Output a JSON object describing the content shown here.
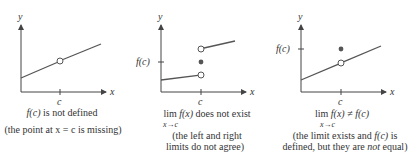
{
  "panels": [
    {
      "id": "not-defined",
      "axis_y_label": "y",
      "axis_x_label": "x",
      "tick_label_c": "c",
      "caption": {
        "line1_func": "f(c)",
        "line1_rest": " is not defined",
        "line2": "(the point at x = c is missing)"
      },
      "points": {
        "open": [
          [
            60,
            61
          ]
        ],
        "filled": []
      },
      "segments": [
        [
          [
            21,
            78
          ],
          [
            101,
            44
          ]
        ]
      ]
    },
    {
      "id": "limit-does-not-exist",
      "axis_y_label": "y",
      "axis_x_label": "x",
      "tick_label_c": "c",
      "tick_label_fc": "f(c)",
      "caption": {
        "lim": "lim",
        "func": "f(x)",
        "rest": " does not exist",
        "sub": "x→c",
        "line2": "(the left and right",
        "line3": "limits do not agree)"
      },
      "points": {
        "open": [
          [
            201,
            75
          ],
          [
            201,
            49
          ]
        ],
        "filled": [
          [
            201,
            62
          ]
        ]
      },
      "segments": [
        [
          [
            161,
            80
          ],
          [
            198,
            75
          ]
        ],
        [
          [
            204,
            48
          ],
          [
            235,
            41
          ]
        ]
      ]
    },
    {
      "id": "limit-not-equal",
      "axis_y_label": "y",
      "axis_x_label": "x",
      "tick_label_c": "c",
      "tick_label_fc": "f(c)",
      "caption": {
        "lim": "lim",
        "expr": "f(x) ≠ f(c)",
        "sub": "x→c",
        "line2_a": "(the limit exists and ",
        "line2_func": "f(c)",
        "line2_b": " is",
        "line3_a": "defined, but they are ",
        "line3_not": "not",
        "line3_b": " equal)"
      },
      "points": {
        "open": [
          [
            341,
            63
          ]
        ],
        "filled": [
          [
            341,
            49
          ]
        ]
      },
      "segments": [
        [
          [
            301,
            80
          ],
          [
            381,
            46
          ]
        ]
      ]
    }
  ],
  "colors": {
    "axis": "#444444",
    "curve": "#555555",
    "dot": "#555555",
    "text": "#333333"
  }
}
